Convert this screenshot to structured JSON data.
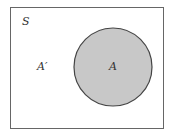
{
  "diagram": {
    "type": "venn",
    "universe_label": "S",
    "set_label": "A",
    "complement_label": "A′",
    "colors": {
      "border": "#555555",
      "set_fill": "#c8c8c8",
      "background": "#ffffff"
    }
  }
}
